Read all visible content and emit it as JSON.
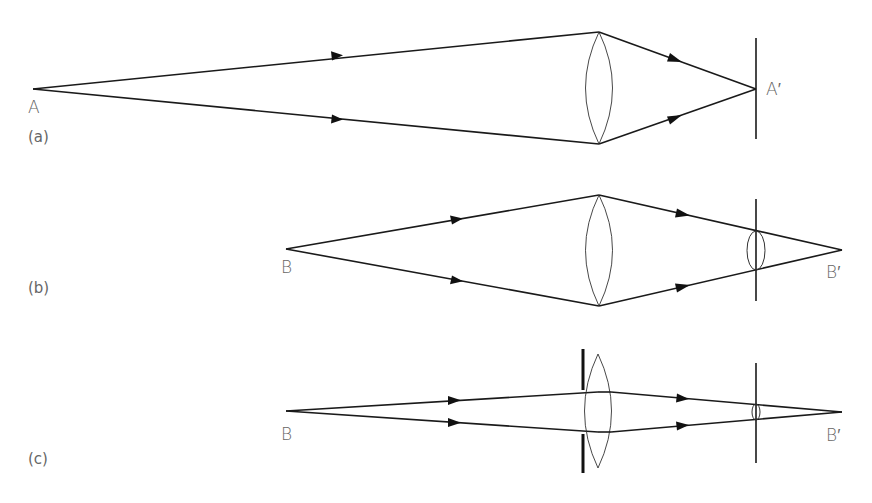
{
  "figure": {
    "colors": {
      "line": "#1a1a1a",
      "label": "#666666",
      "background": "#ffffff"
    },
    "panels": [
      {
        "id": "a",
        "panel_label": "(a)",
        "object_label": "A",
        "image_label": "A′",
        "object_point": [
          33,
          89
        ],
        "lens": {
          "x": 599,
          "top": 32,
          "bottom": 144,
          "half_width": 13
        },
        "screen": {
          "x": 756,
          "top": 38,
          "bottom": 139
        },
        "image_point": [
          756,
          89
        ],
        "aperture_stop": null,
        "blur_circle": null
      },
      {
        "id": "b",
        "panel_label": "(b)",
        "object_label": "B",
        "image_label": "B′",
        "object_point": [
          286,
          249
        ],
        "lens": {
          "x": 599,
          "top": 195,
          "bottom": 306,
          "half_width": 13
        },
        "screen": {
          "x": 756,
          "top": 199,
          "bottom": 301
        },
        "image_point": [
          842,
          250
        ],
        "aperture_stop": null,
        "blur_circle": {
          "top": 231,
          "bottom": 270,
          "half_width": 9
        }
      },
      {
        "id": "c",
        "panel_label": "(c)",
        "object_label": "B",
        "image_label": "B′",
        "object_point": [
          286,
          411
        ],
        "lens": {
          "x": 598,
          "top": 354,
          "bottom": 468,
          "half_width": 13
        },
        "screen": {
          "x": 756,
          "top": 363,
          "bottom": 463
        },
        "image_point": [
          842,
          412
        ],
        "aperture_stop": {
          "x": 583,
          "upper": [
            349,
            390
          ],
          "lower": [
            434,
            473
          ]
        },
        "blur_circle": {
          "top": 404,
          "bottom": 420,
          "half_width": 4
        }
      }
    ]
  }
}
